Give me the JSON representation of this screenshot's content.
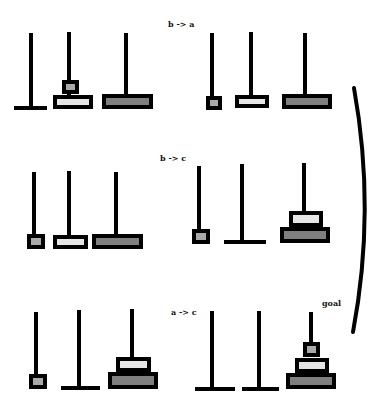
{
  "colors": {
    "outline": "#000000",
    "disk_small": "#a9a9a9",
    "disk_medium": "#e6e6e6",
    "disk_large": "#7f7f7f",
    "background": "#ffffff"
  },
  "labels": {
    "move1": "b -> a",
    "move2": "b -> c",
    "move3": "a -> c",
    "goal": "goal"
  },
  "states": [
    {
      "id": "state-1",
      "pegs": [
        {
          "name": "a",
          "x": 31,
          "top": 33,
          "bottom": 108,
          "base": [
            14,
            47
          ]
        },
        {
          "name": "b",
          "x": 69,
          "top": 32,
          "bottom": 95
        },
        {
          "name": "c",
          "x": 126,
          "top": 33,
          "bottom": 94
        }
      ],
      "disks": [
        {
          "size": "small",
          "x": 62,
          "y": 80,
          "w": 17,
          "h": 14
        },
        {
          "size": "medium",
          "x": 53,
          "y": 95,
          "w": 40,
          "h": 14
        },
        {
          "size": "large",
          "x": 102,
          "y": 94,
          "w": 51,
          "h": 15
        }
      ]
    },
    {
      "id": "state-2",
      "pegs": [
        {
          "name": "a",
          "x": 212,
          "top": 33,
          "bottom": 96
        },
        {
          "name": "b",
          "x": 251,
          "top": 32,
          "bottom": 95
        },
        {
          "name": "c",
          "x": 305,
          "top": 33,
          "bottom": 94
        }
      ],
      "disks": [
        {
          "size": "small",
          "x": 206,
          "y": 96,
          "w": 16,
          "h": 14
        },
        {
          "size": "medium",
          "x": 235,
          "y": 95,
          "w": 34,
          "h": 13
        },
        {
          "size": "large",
          "x": 282,
          "y": 94,
          "w": 50,
          "h": 15
        }
      ]
    },
    {
      "id": "state-3",
      "pegs": [
        {
          "name": "a",
          "x": 34,
          "top": 172,
          "bottom": 234
        },
        {
          "name": "b",
          "x": 69,
          "top": 171,
          "bottom": 235
        },
        {
          "name": "c",
          "x": 116,
          "top": 172,
          "bottom": 234
        }
      ],
      "disks": [
        {
          "size": "small",
          "x": 27,
          "y": 234,
          "w": 18,
          "h": 15
        },
        {
          "size": "medium",
          "x": 53,
          "y": 235,
          "w": 35,
          "h": 14
        },
        {
          "size": "large",
          "x": 92,
          "y": 234,
          "w": 51,
          "h": 15
        }
      ]
    },
    {
      "id": "state-4",
      "pegs": [
        {
          "name": "a",
          "x": 199,
          "top": 166,
          "bottom": 229
        },
        {
          "name": "b",
          "x": 242,
          "top": 164,
          "bottom": 242,
          "base": [
            224,
            266
          ]
        },
        {
          "name": "c",
          "x": 304,
          "top": 163,
          "bottom": 211
        }
      ],
      "disks": [
        {
          "size": "small",
          "x": 192,
          "y": 229,
          "w": 18,
          "h": 15
        },
        {
          "size": "medium",
          "x": 289,
          "y": 211,
          "w": 34,
          "h": 16
        },
        {
          "size": "large",
          "x": 280,
          "y": 227,
          "w": 50,
          "h": 16
        }
      ]
    },
    {
      "id": "state-5",
      "pegs": [
        {
          "name": "a",
          "x": 36,
          "top": 312,
          "bottom": 374
        },
        {
          "name": "b",
          "x": 79,
          "top": 310,
          "bottom": 388,
          "base": [
            61,
            100
          ]
        },
        {
          "name": "c",
          "x": 132,
          "top": 309,
          "bottom": 357
        }
      ],
      "disks": [
        {
          "size": "small",
          "x": 29,
          "y": 374,
          "w": 18,
          "h": 15
        },
        {
          "size": "medium",
          "x": 116,
          "y": 357,
          "w": 35,
          "h": 15
        },
        {
          "size": "large",
          "x": 108,
          "y": 372,
          "w": 50,
          "h": 17
        }
      ]
    },
    {
      "id": "state-6-goal",
      "pegs": [
        {
          "name": "a",
          "x": 212,
          "top": 311,
          "bottom": 389,
          "base": [
            195,
            235
          ]
        },
        {
          "name": "b",
          "x": 259,
          "top": 311,
          "bottom": 389,
          "base": [
            242,
            279
          ]
        },
        {
          "name": "c",
          "x": 311,
          "top": 312,
          "bottom": 342
        }
      ],
      "disks": [
        {
          "size": "small",
          "x": 303,
          "y": 342,
          "w": 17,
          "h": 15
        },
        {
          "size": "medium",
          "x": 295,
          "y": 358,
          "w": 34,
          "h": 15
        },
        {
          "size": "large",
          "x": 286,
          "y": 373,
          "w": 50,
          "h": 16
        }
      ]
    }
  ],
  "label_positions": {
    "move1": {
      "x": 168,
      "y": 20
    },
    "move2": {
      "x": 160,
      "y": 154
    },
    "move3": {
      "x": 171,
      "y": 308
    },
    "goal": {
      "x": 322,
      "y": 299
    }
  },
  "bracket": {
    "start": [
      354,
      88
    ],
    "control": [
      376,
      210
    ],
    "end": [
      353,
      332
    ]
  }
}
